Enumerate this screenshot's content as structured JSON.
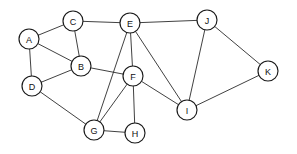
{
  "diagram": {
    "type": "undirected-graph",
    "title": "",
    "background_color": "#ffffff",
    "node_fill_color": "#ffffff",
    "node_stroke_color": "#1a1a1a",
    "edge_color": "#2b2b2b",
    "label_color": "#111111",
    "node_radius": 10,
    "node_count": 11,
    "edge_count": 19,
    "nodes": [
      {
        "id": "A",
        "label": "A",
        "x": 29,
        "y": 39
      },
      {
        "id": "B",
        "label": "B",
        "x": 81,
        "y": 66
      },
      {
        "id": "C",
        "label": "C",
        "x": 73,
        "y": 21
      },
      {
        "id": "D",
        "label": "D",
        "x": 32,
        "y": 86
      },
      {
        "id": "E",
        "label": "E",
        "x": 130,
        "y": 23
      },
      {
        "id": "F",
        "label": "F",
        "x": 133,
        "y": 76
      },
      {
        "id": "G",
        "label": "G",
        "x": 94,
        "y": 130
      },
      {
        "id": "H",
        "label": "H",
        "x": 135,
        "y": 133
      },
      {
        "id": "I",
        "label": "I",
        "x": 187,
        "y": 110
      },
      {
        "id": "J",
        "label": "J",
        "x": 207,
        "y": 20
      },
      {
        "id": "K",
        "label": "K",
        "x": 268,
        "y": 71
      }
    ],
    "edges": [
      {
        "source": "A",
        "target": "C"
      },
      {
        "source": "A",
        "target": "B"
      },
      {
        "source": "A",
        "target": "D"
      },
      {
        "source": "C",
        "target": "B"
      },
      {
        "source": "C",
        "target": "E"
      },
      {
        "source": "B",
        "target": "D"
      },
      {
        "source": "B",
        "target": "F"
      },
      {
        "source": "D",
        "target": "G"
      },
      {
        "source": "E",
        "target": "F"
      },
      {
        "source": "E",
        "target": "G"
      },
      {
        "source": "E",
        "target": "I"
      },
      {
        "source": "E",
        "target": "J"
      },
      {
        "source": "F",
        "target": "G"
      },
      {
        "source": "F",
        "target": "H"
      },
      {
        "source": "F",
        "target": "I"
      },
      {
        "source": "G",
        "target": "H"
      },
      {
        "source": "I",
        "target": "J"
      },
      {
        "source": "I",
        "target": "K"
      },
      {
        "source": "J",
        "target": "K"
      }
    ]
  }
}
